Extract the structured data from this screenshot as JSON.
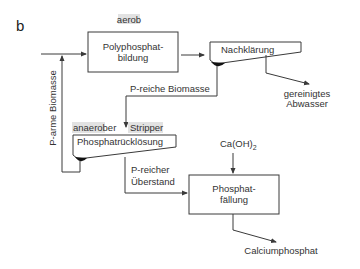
{
  "figure": {
    "panel_label": "b",
    "colors": {
      "line": "#3a3a3a",
      "text": "#333333",
      "label_highlight": "#e2e2e2",
      "box_fill": "#ffffff"
    }
  },
  "nodes": {
    "polyphosphat": {
      "line1": "Polyphosphat-",
      "line2": "bildung",
      "condition": "aerob"
    },
    "nachklaerung": {
      "label": "Nachklärung"
    },
    "ruecklosung": {
      "label": "Phosphatrücklösung",
      "condition_left": "anaerober",
      "condition_right": "Stripper"
    },
    "faellung": {
      "line1": "Phosphat-",
      "line2": "fällung"
    }
  },
  "edges": {
    "p_arme_biomasse": "P-arme Biomasse",
    "p_reiche_biomasse": "P-reiche Biomasse",
    "gereinigtes_abwasser": {
      "line1": "gereinigtes",
      "line2": "Abwasser"
    },
    "p_reicher_ueberstand": {
      "line1": "P-reicher",
      "line2": "Überstand"
    },
    "reagent": {
      "base": "Ca(OH)",
      "subscript": "2"
    },
    "product": "Calciumphosphat"
  }
}
